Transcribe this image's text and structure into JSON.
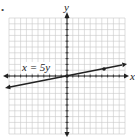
{
  "bullet": "•",
  "graph": {
    "x_axis_label": "x",
    "y_axis_label": "y",
    "equation_label": "x = 5y",
    "grid": {
      "x_min": -10,
      "x_max": 10,
      "y_min": -10,
      "y_max": 10,
      "step": 1
    },
    "line": {
      "equation": "x = 5y",
      "slope": 0.2,
      "intercept": 0
    },
    "points": [
      {
        "x": 0,
        "y": 0
      },
      {
        "x": 5,
        "y": 1
      }
    ],
    "colors": {
      "grid": "#c8c8c8",
      "axis": "#222222",
      "line": "#222222"
    }
  }
}
